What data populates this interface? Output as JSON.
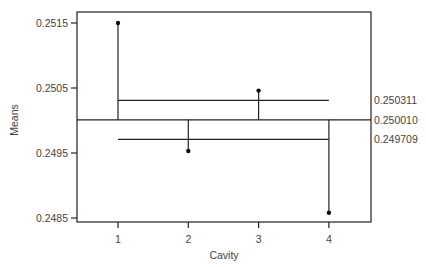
{
  "chart_data": {
    "type": "scatter",
    "subtype": "analysis-of-means",
    "title": "",
    "xlabel": "Cavity",
    "ylabel": "Means",
    "categories": [
      "1",
      "2",
      "3",
      "4"
    ],
    "x": [
      1,
      2,
      3,
      4
    ],
    "values": [
      0.2515,
      0.24953,
      0.25046,
      0.24858
    ],
    "center_line": 0.25001,
    "upper_decision_limit": 0.250311,
    "lower_decision_limit": 0.249709,
    "ylim": [
      0.24848,
      0.25168
    ],
    "xlim": [
      0.42,
      4.62
    ],
    "yticks": [
      0.2485,
      0.2495,
      0.2505,
      0.2515
    ],
    "ytick_labels": [
      "0.2485",
      "0.2495",
      "0.2505",
      "0.2515"
    ],
    "xtick_labels": [
      "1",
      "2",
      "3",
      "4"
    ],
    "line_labels": [
      "0.250311",
      "0.250010",
      "0.249709"
    ],
    "grid": false,
    "legend": null
  }
}
